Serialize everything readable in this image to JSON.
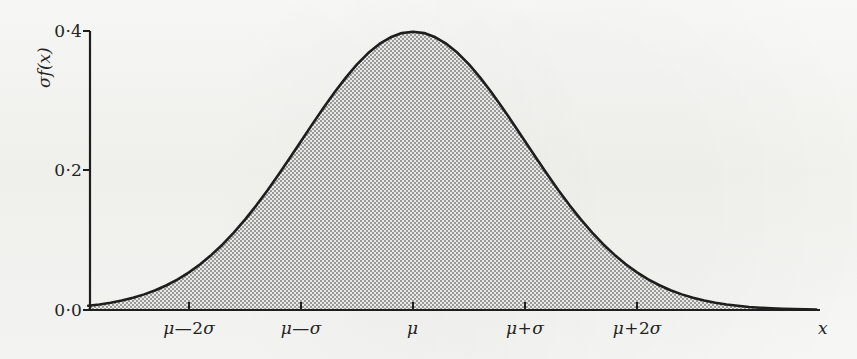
{
  "figure": {
    "background_color": "#f7f7f5",
    "ink_color": "#232323",
    "fill_color": "#b4b4b4",
    "width": 857,
    "height": 359
  },
  "axes": {
    "y_title": "σf(x)",
    "x_title": "x",
    "y_ticks": [
      {
        "label": "0·0",
        "value": 0.0,
        "y_px": 310
      },
      {
        "label": "0·2",
        "value": 0.2,
        "y_px": 170
      },
      {
        "label": "0·4",
        "value": 0.4,
        "y_px": 31
      }
    ],
    "x_ticks": [
      {
        "label_head": "μ",
        "op": "—",
        "num": "2",
        "tail": "σ",
        "value": -2,
        "x_px": 189
      },
      {
        "label_head": "μ",
        "op": "—",
        "num": "",
        "tail": "σ",
        "value": -1,
        "x_px": 301
      },
      {
        "label_head": "μ",
        "op": "",
        "num": "",
        "tail": "",
        "value": 0,
        "x_px": 413
      },
      {
        "label_head": "μ",
        "op": "+",
        "num": "",
        "tail": "σ",
        "value": 1,
        "x_px": 525
      },
      {
        "label_head": "μ",
        "op": "+",
        "num": "2",
        "tail": "σ",
        "value": 2,
        "x_px": 637
      }
    ]
  },
  "chart_data": {
    "type": "area",
    "title": "",
    "subtitle": "",
    "xlabel": "x",
    "ylabel": "σf(x)",
    "legend": [],
    "grid": false,
    "xlim": [
      -2.9,
      3.6
    ],
    "ylim": [
      0.0,
      0.4
    ],
    "x_tick_labels": [
      "μ—2σ",
      "μ—σ",
      "μ",
      "μ+σ",
      "μ+2σ"
    ],
    "x_tick_values": [
      -2,
      -1,
      0,
      1,
      2
    ],
    "y_tick_labels": [
      "0·0",
      "0·2",
      "0·4"
    ],
    "y_tick_values": [
      0.0,
      0.2,
      0.4
    ],
    "formula": "sigma*f(x) = (1/sqrt(2*pi)) * exp(-z^2/2), z = (x-mu)/sigma",
    "series": [
      {
        "name": "σf(x)",
        "fill": "#b4b4b4",
        "stroke": "#1e1e1e",
        "x": [
          -2.9,
          -2.8,
          -2.7,
          -2.6,
          -2.5,
          -2.4,
          -2.3,
          -2.2,
          -2.1,
          -2.0,
          -1.9,
          -1.8,
          -1.7,
          -1.6,
          -1.5,
          -1.4,
          -1.3,
          -1.2,
          -1.1,
          -1.0,
          -0.9,
          -0.8,
          -0.7,
          -0.6,
          -0.5,
          -0.4,
          -0.3,
          -0.2,
          -0.1,
          0.0,
          0.1,
          0.2,
          0.3,
          0.4,
          0.5,
          0.6,
          0.7,
          0.8,
          0.9,
          1.0,
          1.1,
          1.2,
          1.3,
          1.4,
          1.5,
          1.6,
          1.7,
          1.8,
          1.9,
          2.0,
          2.1,
          2.2,
          2.3,
          2.4,
          2.5,
          2.6,
          2.7,
          2.8,
          2.9,
          3.0,
          3.1,
          3.2,
          3.3,
          3.4,
          3.5,
          3.6
        ],
        "y": [
          0.006,
          0.0079,
          0.0104,
          0.0136,
          0.0175,
          0.0224,
          0.0283,
          0.0355,
          0.044,
          0.054,
          0.0656,
          0.079,
          0.094,
          0.1109,
          0.1295,
          0.1497,
          0.1714,
          0.1942,
          0.2179,
          0.242,
          0.2661,
          0.2897,
          0.3123,
          0.3332,
          0.3521,
          0.3683,
          0.3814,
          0.391,
          0.397,
          0.3989,
          0.397,
          0.391,
          0.3814,
          0.3683,
          0.3521,
          0.3332,
          0.3123,
          0.2897,
          0.2661,
          0.242,
          0.2179,
          0.1942,
          0.1714,
          0.1497,
          0.1295,
          0.1109,
          0.094,
          0.079,
          0.0656,
          0.054,
          0.044,
          0.0355,
          0.0283,
          0.0224,
          0.0175,
          0.0136,
          0.0104,
          0.0079,
          0.006,
          0.0044,
          0.0033,
          0.0024,
          0.0017,
          0.0012,
          0.0009,
          0.0006
        ]
      }
    ]
  },
  "geometry": {
    "origin_x_px": 90,
    "origin_y_px": 310,
    "x_per_unit_px": 112,
    "y_top_px": 31,
    "axis_right_px": 820
  }
}
